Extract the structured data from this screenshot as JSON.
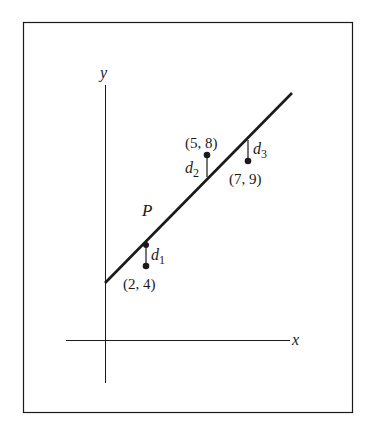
{
  "figure": {
    "axes": {
      "x_label": "x",
      "y_label": "y"
    },
    "line_label": "P",
    "points": [
      {
        "label": "(2, 4)",
        "x": 2,
        "y": 4,
        "residual_label": "d",
        "residual_sub": "1"
      },
      {
        "label": "(5, 8)",
        "x": 5,
        "y": 8,
        "residual_label": "d",
        "residual_sub": "2"
      },
      {
        "label": "(7, 9)",
        "x": 7,
        "y": 9,
        "residual_label": "d",
        "residual_sub": "3"
      }
    ],
    "colors": {
      "ink": "#1a1a1a",
      "background": "#ffffff"
    }
  }
}
